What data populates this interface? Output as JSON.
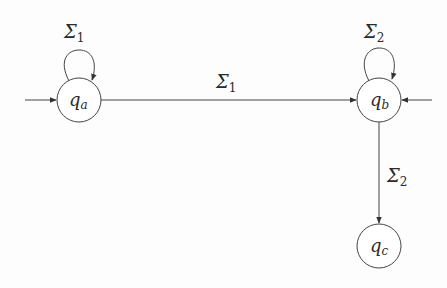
{
  "diagram": {
    "type": "finite-automaton",
    "states": [
      {
        "id": "qa",
        "label": "q",
        "subscript": "a",
        "cx": 79,
        "cy": 100,
        "r": 22,
        "initial": true
      },
      {
        "id": "qb",
        "label": "q",
        "subscript": "b",
        "cx": 379,
        "cy": 100,
        "r": 22,
        "initial": true
      },
      {
        "id": "qc",
        "label": "q",
        "subscript": "c",
        "cx": 379,
        "cy": 246,
        "r": 22,
        "initial": false
      }
    ],
    "transitions": [
      {
        "from": "qa",
        "to": "qa",
        "label": "Σ",
        "subscript": "1"
      },
      {
        "from": "qa",
        "to": "qb",
        "label": "Σ",
        "subscript": "1"
      },
      {
        "from": "qb",
        "to": "qb",
        "label": "Σ",
        "subscript": "2"
      },
      {
        "from": "qb",
        "to": "qc",
        "label": "Σ",
        "subscript": "2"
      }
    ],
    "colors": {
      "stroke": "#3a3a3a",
      "text": "#2a2a2a",
      "background": "#fdfdfd"
    }
  },
  "labels": {
    "qa": {
      "main": "q",
      "sub": "a"
    },
    "qb": {
      "main": "q",
      "sub": "b"
    },
    "qc": {
      "main": "q",
      "sub": "c"
    },
    "loop_qa": {
      "main": "Σ",
      "sub": "1"
    },
    "edge_qa_qb": {
      "main": "Σ",
      "sub": "1"
    },
    "loop_qb": {
      "main": "Σ",
      "sub": "2"
    },
    "edge_qb_qc": {
      "main": "Σ",
      "sub": "2"
    }
  }
}
